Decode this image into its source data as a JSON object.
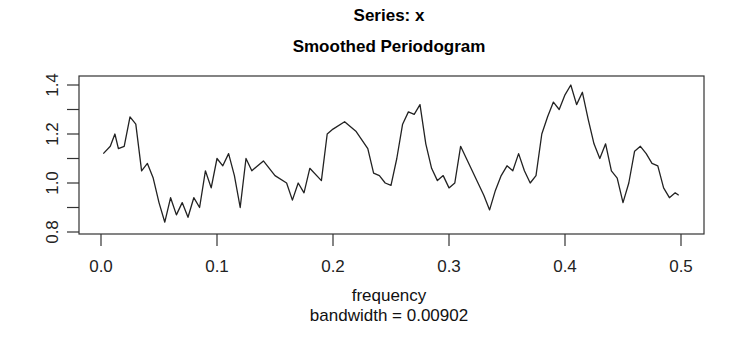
{
  "title": "Series: x",
  "subtitle": "Smoothed Periodogram",
  "xlabel": "frequency",
  "sub_xlabel": "bandwidth = 0.00902",
  "ylabel": "",
  "x_ticks": [
    "0.0",
    "0.1",
    "0.2",
    "0.3",
    "0.4",
    "0.5"
  ],
  "y_ticks": [
    "0.8",
    "1.0",
    "1.2",
    "1.4"
  ],
  "chart_data": {
    "type": "line",
    "title": "Series: x",
    "subtitle": "Smoothed Periodogram",
    "xlabel": "frequency",
    "sub_xlabel": "bandwidth = 0.00902",
    "ylabel": "spectrum",
    "xlim": [
      0,
      0.5
    ],
    "ylim": [
      0.8,
      1.4
    ],
    "x_tick_labels": [
      "0.0",
      "0.1",
      "0.2",
      "0.3",
      "0.4",
      "0.5"
    ],
    "y_tick_labels": [
      "0.8",
      "1.0",
      "1.2",
      "1.4"
    ],
    "grid": false,
    "legend": null,
    "series": [
      {
        "name": "smoothed periodogram",
        "x": [
          0.002,
          0.008,
          0.012,
          0.015,
          0.02,
          0.025,
          0.03,
          0.035,
          0.04,
          0.045,
          0.05,
          0.055,
          0.06,
          0.065,
          0.07,
          0.075,
          0.08,
          0.085,
          0.09,
          0.095,
          0.1,
          0.105,
          0.11,
          0.115,
          0.12,
          0.125,
          0.13,
          0.14,
          0.15,
          0.16,
          0.165,
          0.17,
          0.175,
          0.18,
          0.19,
          0.195,
          0.2,
          0.21,
          0.22,
          0.23,
          0.235,
          0.24,
          0.245,
          0.25,
          0.255,
          0.26,
          0.265,
          0.27,
          0.275,
          0.28,
          0.285,
          0.29,
          0.295,
          0.3,
          0.305,
          0.31,
          0.315,
          0.32,
          0.325,
          0.33,
          0.335,
          0.34,
          0.345,
          0.35,
          0.355,
          0.36,
          0.365,
          0.37,
          0.375,
          0.38,
          0.385,
          0.39,
          0.395,
          0.4,
          0.405,
          0.41,
          0.415,
          0.42,
          0.425,
          0.43,
          0.435,
          0.44,
          0.445,
          0.45,
          0.455,
          0.46,
          0.465,
          0.47,
          0.475,
          0.48,
          0.485,
          0.49,
          0.495,
          0.498
        ],
        "values": [
          1.12,
          1.15,
          1.2,
          1.14,
          1.15,
          1.27,
          1.24,
          1.05,
          1.08,
          1.02,
          0.92,
          0.84,
          0.94,
          0.87,
          0.92,
          0.86,
          0.94,
          0.9,
          1.05,
          0.98,
          1.1,
          1.07,
          1.12,
          1.03,
          0.9,
          1.1,
          1.05,
          1.09,
          1.03,
          1.0,
          0.93,
          1.0,
          0.96,
          1.06,
          1.01,
          1.2,
          1.22,
          1.25,
          1.21,
          1.14,
          1.04,
          1.03,
          1.0,
          0.99,
          1.1,
          1.24,
          1.29,
          1.28,
          1.32,
          1.16,
          1.06,
          1.01,
          1.03,
          0.98,
          1.0,
          1.15,
          1.1,
          1.05,
          1.0,
          0.95,
          0.89,
          0.97,
          1.03,
          1.07,
          1.05,
          1.12,
          1.05,
          1.0,
          1.03,
          1.2,
          1.27,
          1.33,
          1.3,
          1.36,
          1.4,
          1.32,
          1.37,
          1.26,
          1.16,
          1.1,
          1.16,
          1.05,
          1.02,
          0.92,
          1.0,
          1.13,
          1.15,
          1.12,
          1.08,
          1.07,
          0.98,
          0.94,
          0.96,
          0.95
        ]
      }
    ]
  },
  "colors": {
    "line": "#222222",
    "axis": "#333333",
    "background": "#ffffff"
  }
}
